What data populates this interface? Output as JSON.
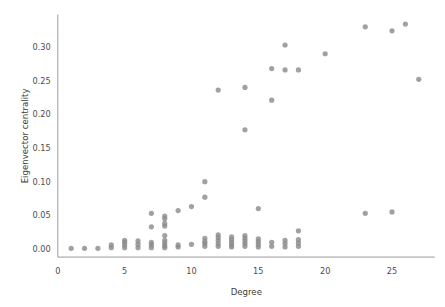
{
  "chart_data": {
    "type": "scatter",
    "title": "",
    "xlabel": "Degree",
    "ylabel": "Eigenvector centrality",
    "xlim": [
      0,
      28.2
    ],
    "ylim": [
      -0.012,
      0.348
    ],
    "grid": false,
    "legend": null,
    "xticks": [
      0,
      5,
      10,
      15,
      20,
      25
    ],
    "xticklabels": [
      "0",
      "5",
      "10",
      "15",
      "20",
      "25"
    ],
    "yticks": [
      0.0,
      0.05,
      0.1,
      0.15,
      0.2,
      0.25,
      0.3
    ],
    "yticklabels": [
      "0.00",
      "0.05",
      "0.10",
      "0.15",
      "0.20",
      "0.25",
      "0.30"
    ],
    "marker": {
      "shape": "circle",
      "color": "#8a8a8a",
      "opacity": 0.8,
      "radius_px": 2.6
    },
    "n_points": 96,
    "points": [
      {
        "x": 1,
        "y": 0.001
      },
      {
        "x": 2,
        "y": 0.001
      },
      {
        "x": 3,
        "y": 0.001
      },
      {
        "x": 4,
        "y": 0.002
      },
      {
        "x": 4,
        "y": 0.006
      },
      {
        "x": 5,
        "y": 0.002
      },
      {
        "x": 5,
        "y": 0.006
      },
      {
        "x": 5,
        "y": 0.01
      },
      {
        "x": 5,
        "y": 0.013
      },
      {
        "x": 6,
        "y": 0.002
      },
      {
        "x": 6,
        "y": 0.007
      },
      {
        "x": 6,
        "y": 0.012
      },
      {
        "x": 7,
        "y": 0.002
      },
      {
        "x": 7,
        "y": 0.006
      },
      {
        "x": 7,
        "y": 0.01
      },
      {
        "x": 7,
        "y": 0.033
      },
      {
        "x": 7,
        "y": 0.053
      },
      {
        "x": 8,
        "y": 0.002
      },
      {
        "x": 8,
        "y": 0.005
      },
      {
        "x": 8,
        "y": 0.009
      },
      {
        "x": 8,
        "y": 0.013
      },
      {
        "x": 8,
        "y": 0.02
      },
      {
        "x": 8,
        "y": 0.034
      },
      {
        "x": 8,
        "y": 0.038
      },
      {
        "x": 8,
        "y": 0.045
      },
      {
        "x": 8,
        "y": 0.049
      },
      {
        "x": 9,
        "y": 0.003
      },
      {
        "x": 9,
        "y": 0.006
      },
      {
        "x": 9,
        "y": 0.057
      },
      {
        "x": 10,
        "y": 0.007
      },
      {
        "x": 10,
        "y": 0.063
      },
      {
        "x": 11,
        "y": 0.004
      },
      {
        "x": 11,
        "y": 0.008
      },
      {
        "x": 11,
        "y": 0.011
      },
      {
        "x": 11,
        "y": 0.016
      },
      {
        "x": 11,
        "y": 0.077
      },
      {
        "x": 11,
        "y": 0.1
      },
      {
        "x": 12,
        "y": 0.004
      },
      {
        "x": 12,
        "y": 0.008
      },
      {
        "x": 12,
        "y": 0.013
      },
      {
        "x": 12,
        "y": 0.017
      },
      {
        "x": 12,
        "y": 0.021
      },
      {
        "x": 12,
        "y": 0.236
      },
      {
        "x": 13,
        "y": 0.003
      },
      {
        "x": 13,
        "y": 0.006
      },
      {
        "x": 13,
        "y": 0.01
      },
      {
        "x": 13,
        "y": 0.014
      },
      {
        "x": 13,
        "y": 0.018
      },
      {
        "x": 14,
        "y": 0.004
      },
      {
        "x": 14,
        "y": 0.008
      },
      {
        "x": 14,
        "y": 0.012
      },
      {
        "x": 14,
        "y": 0.016
      },
      {
        "x": 14,
        "y": 0.02
      },
      {
        "x": 14,
        "y": 0.177
      },
      {
        "x": 14,
        "y": 0.24
      },
      {
        "x": 15,
        "y": 0.003
      },
      {
        "x": 15,
        "y": 0.007
      },
      {
        "x": 15,
        "y": 0.011
      },
      {
        "x": 15,
        "y": 0.015
      },
      {
        "x": 15,
        "y": 0.06
      },
      {
        "x": 16,
        "y": 0.004
      },
      {
        "x": 16,
        "y": 0.01
      },
      {
        "x": 16,
        "y": 0.221
      },
      {
        "x": 16,
        "y": 0.268
      },
      {
        "x": 17,
        "y": 0.003
      },
      {
        "x": 17,
        "y": 0.008
      },
      {
        "x": 17,
        "y": 0.013
      },
      {
        "x": 17,
        "y": 0.266
      },
      {
        "x": 17,
        "y": 0.303
      },
      {
        "x": 18,
        "y": 0.004
      },
      {
        "x": 18,
        "y": 0.009
      },
      {
        "x": 18,
        "y": 0.014
      },
      {
        "x": 18,
        "y": 0.027
      },
      {
        "x": 18,
        "y": 0.266
      },
      {
        "x": 20,
        "y": 0.29
      },
      {
        "x": 23,
        "y": 0.053
      },
      {
        "x": 23,
        "y": 0.33
      },
      {
        "x": 25,
        "y": 0.055
      },
      {
        "x": 25,
        "y": 0.324
      },
      {
        "x": 26,
        "y": 0.334
      },
      {
        "x": 27,
        "y": 0.252
      }
    ]
  },
  "figure": {
    "background_color": "#ffffff",
    "axis_color": "#9a9a9a",
    "tick_label_color": "#4d4d4d",
    "axis_title_color": "#3d3d3d"
  }
}
